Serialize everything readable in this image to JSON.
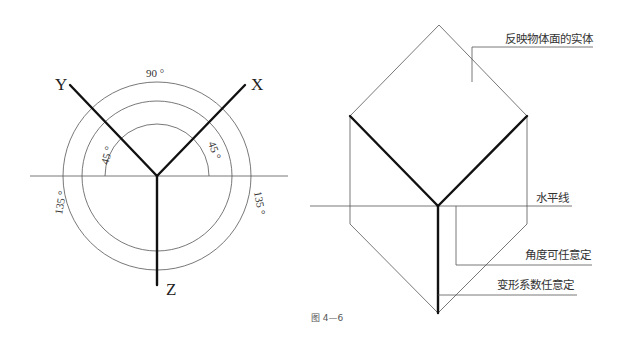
{
  "left_figure": {
    "axes": {
      "x": "X",
      "y": "Y",
      "z": "Z"
    },
    "angles": {
      "top": "90 °",
      "left_inner": "45 °",
      "right_inner": "45 °",
      "left_outer": "135 °",
      "right_outer": "135 °"
    }
  },
  "right_figure": {
    "annotations": {
      "face": "反映物体面的实体",
      "horizontal": "水平线",
      "angle": "角度可任意定",
      "coefficient": "变形系数任意定"
    }
  },
  "caption": "图 4—6"
}
